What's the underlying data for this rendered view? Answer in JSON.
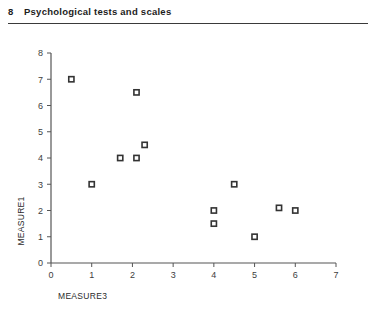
{
  "header": {
    "chapter_number": "8",
    "chapter_title": "Psychological tests and scales"
  },
  "chart_data": {
    "type": "scatter",
    "title": "",
    "xlabel": "MEASURE3",
    "ylabel": "MEASURE1",
    "xlim": [
      0,
      7
    ],
    "ylim": [
      0,
      8
    ],
    "xticks": [
      0,
      1,
      2,
      3,
      4,
      5,
      6,
      7
    ],
    "yticks": [
      0,
      1,
      2,
      3,
      4,
      5,
      6,
      7,
      8
    ],
    "xtick_labels": [
      "0",
      "1",
      "2",
      "3",
      "4",
      "5",
      "6",
      "7"
    ],
    "ytick_labels": [
      "0",
      "1",
      "2",
      "3",
      "4",
      "5",
      "6",
      "7",
      "8"
    ],
    "grid": false,
    "legend": false,
    "marker": "open-square",
    "marker_color": "#333333",
    "series": [
      {
        "name": "MEASURE1 vs MEASURE3",
        "points": [
          {
            "x": 0.5,
            "y": 7.0
          },
          {
            "x": 1.0,
            "y": 3.0
          },
          {
            "x": 1.7,
            "y": 4.0
          },
          {
            "x": 2.1,
            "y": 4.0
          },
          {
            "x": 2.1,
            "y": 6.5
          },
          {
            "x": 2.3,
            "y": 4.5
          },
          {
            "x": 4.0,
            "y": 2.0
          },
          {
            "x": 4.0,
            "y": 1.5
          },
          {
            "x": 4.5,
            "y": 3.0
          },
          {
            "x": 5.0,
            "y": 1.0
          },
          {
            "x": 5.6,
            "y": 2.1
          },
          {
            "x": 6.0,
            "y": 2.0
          }
        ]
      }
    ]
  }
}
